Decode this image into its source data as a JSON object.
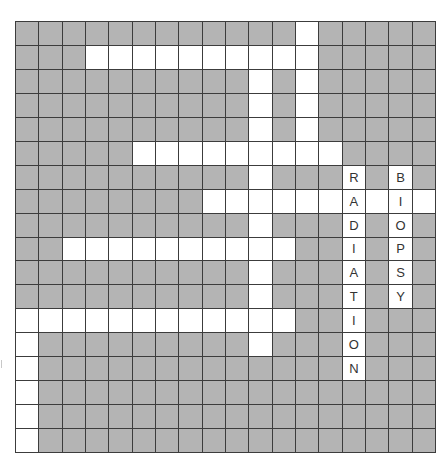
{
  "puzzle": {
    "rows": 18,
    "cols": 18,
    "colors": {
      "block": "#b4b4b4",
      "open": "#ffffff",
      "line": "#3c3c3c",
      "letter": "#333333"
    },
    "open_cells": [
      [
        0,
        12
      ],
      [
        1,
        3
      ],
      [
        1,
        4
      ],
      [
        1,
        5
      ],
      [
        1,
        6
      ],
      [
        1,
        7
      ],
      [
        1,
        8
      ],
      [
        1,
        9
      ],
      [
        1,
        10
      ],
      [
        1,
        11
      ],
      [
        1,
        12
      ],
      [
        2,
        10
      ],
      [
        2,
        12
      ],
      [
        3,
        10
      ],
      [
        3,
        12
      ],
      [
        4,
        10
      ],
      [
        4,
        12
      ],
      [
        5,
        5
      ],
      [
        5,
        6
      ],
      [
        5,
        7
      ],
      [
        5,
        8
      ],
      [
        5,
        9
      ],
      [
        5,
        10
      ],
      [
        5,
        11
      ],
      [
        5,
        12
      ],
      [
        5,
        13
      ],
      [
        6,
        10
      ],
      [
        6,
        14
      ],
      [
        6,
        16
      ],
      [
        7,
        8
      ],
      [
        7,
        9
      ],
      [
        7,
        10
      ],
      [
        7,
        11
      ],
      [
        7,
        12
      ],
      [
        7,
        13
      ],
      [
        7,
        14
      ],
      [
        7,
        15
      ],
      [
        7,
        16
      ],
      [
        7,
        17
      ],
      [
        8,
        10
      ],
      [
        8,
        14
      ],
      [
        8,
        16
      ],
      [
        9,
        2
      ],
      [
        9,
        3
      ],
      [
        9,
        4
      ],
      [
        9,
        5
      ],
      [
        9,
        6
      ],
      [
        9,
        7
      ],
      [
        9,
        8
      ],
      [
        9,
        9
      ],
      [
        9,
        10
      ],
      [
        9,
        11
      ],
      [
        9,
        14
      ],
      [
        9,
        16
      ],
      [
        10,
        10
      ],
      [
        10,
        14
      ],
      [
        10,
        16
      ],
      [
        11,
        10
      ],
      [
        11,
        14
      ],
      [
        11,
        16
      ],
      [
        12,
        0
      ],
      [
        12,
        1
      ],
      [
        12,
        2
      ],
      [
        12,
        3
      ],
      [
        12,
        4
      ],
      [
        12,
        5
      ],
      [
        12,
        6
      ],
      [
        12,
        7
      ],
      [
        12,
        8
      ],
      [
        12,
        9
      ],
      [
        12,
        10
      ],
      [
        12,
        11
      ],
      [
        12,
        14
      ],
      [
        13,
        0
      ],
      [
        13,
        10
      ],
      [
        13,
        14
      ],
      [
        14,
        0
      ],
      [
        14,
        14
      ],
      [
        15,
        0
      ],
      [
        16,
        0
      ],
      [
        17,
        0
      ]
    ],
    "filled_words": [
      {
        "word": "RADIATION",
        "direction": "down",
        "start": [
          6,
          14
        ]
      },
      {
        "word": "BIOPSY",
        "direction": "down",
        "start": [
          6,
          16
        ]
      }
    ]
  }
}
